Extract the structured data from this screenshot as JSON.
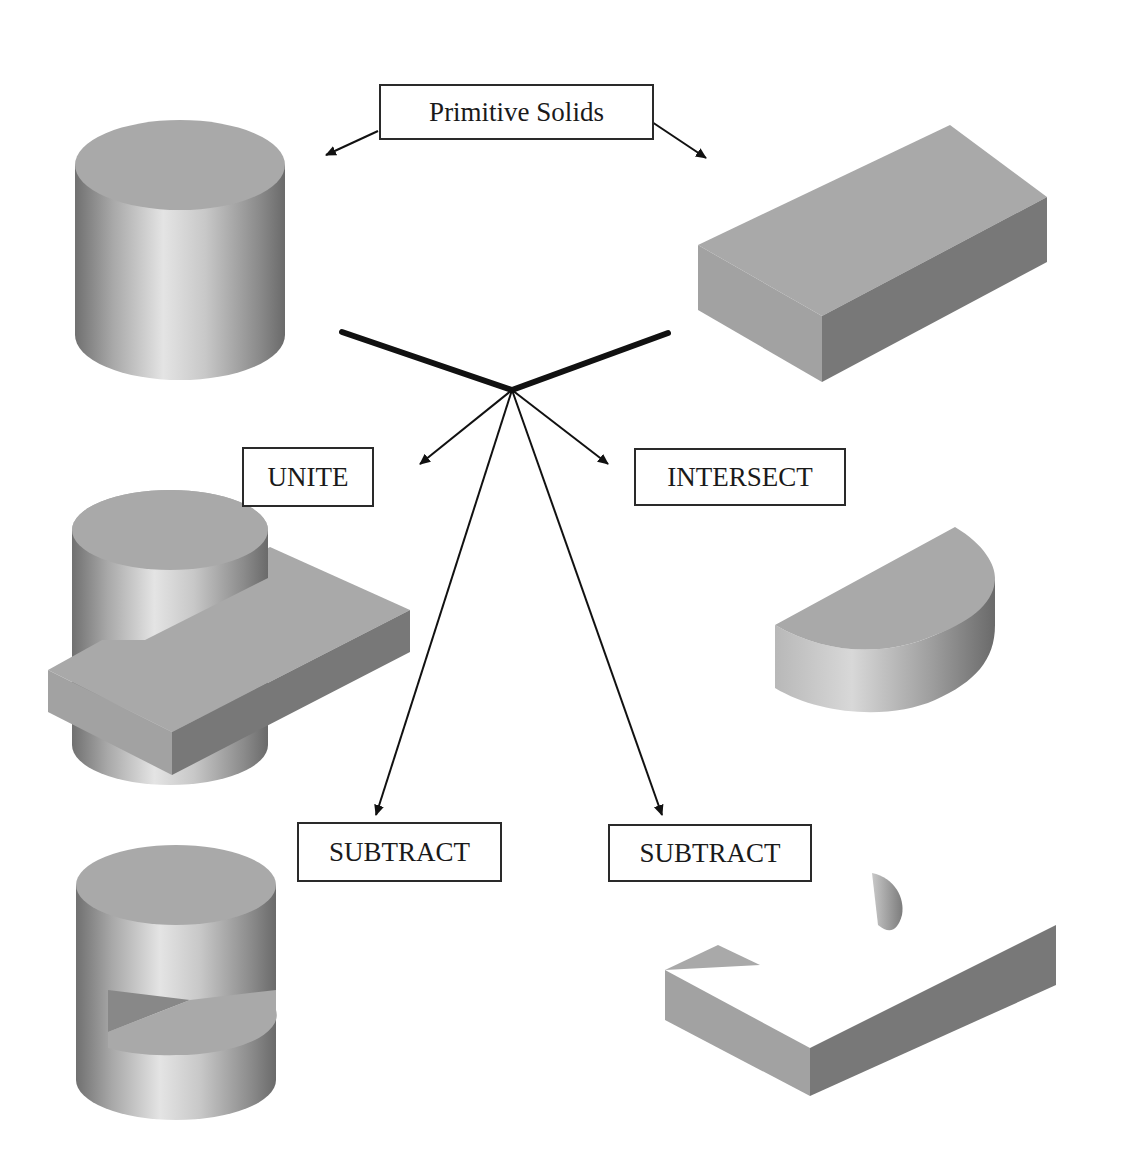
{
  "diagram": {
    "title_label": "Primitive Solids",
    "operations": {
      "unite": "UNITE",
      "intersect": "INTERSECT",
      "subtract_left": "SUBTRACT",
      "subtract_right": "SUBTRACT"
    },
    "solids": {
      "primitive_1": "cylinder",
      "primitive_2": "rectangular box",
      "unite_result": "cylinder united with box",
      "intersect_result": "half-cylinder (intersection)",
      "subtract_left_result": "cylinder minus box (slotted cylinder)",
      "subtract_right_result": "box minus cylinder (box with semicircular cut)"
    },
    "colors": {
      "background": "#ffffff",
      "line": "#111111",
      "top_face": "#a9a9a9",
      "left_face": "#a4a4a4",
      "right_face": "#7a7a7a",
      "cylinder_dark": "#6e6e6e",
      "cylinder_light": "#e2e2e2"
    }
  }
}
